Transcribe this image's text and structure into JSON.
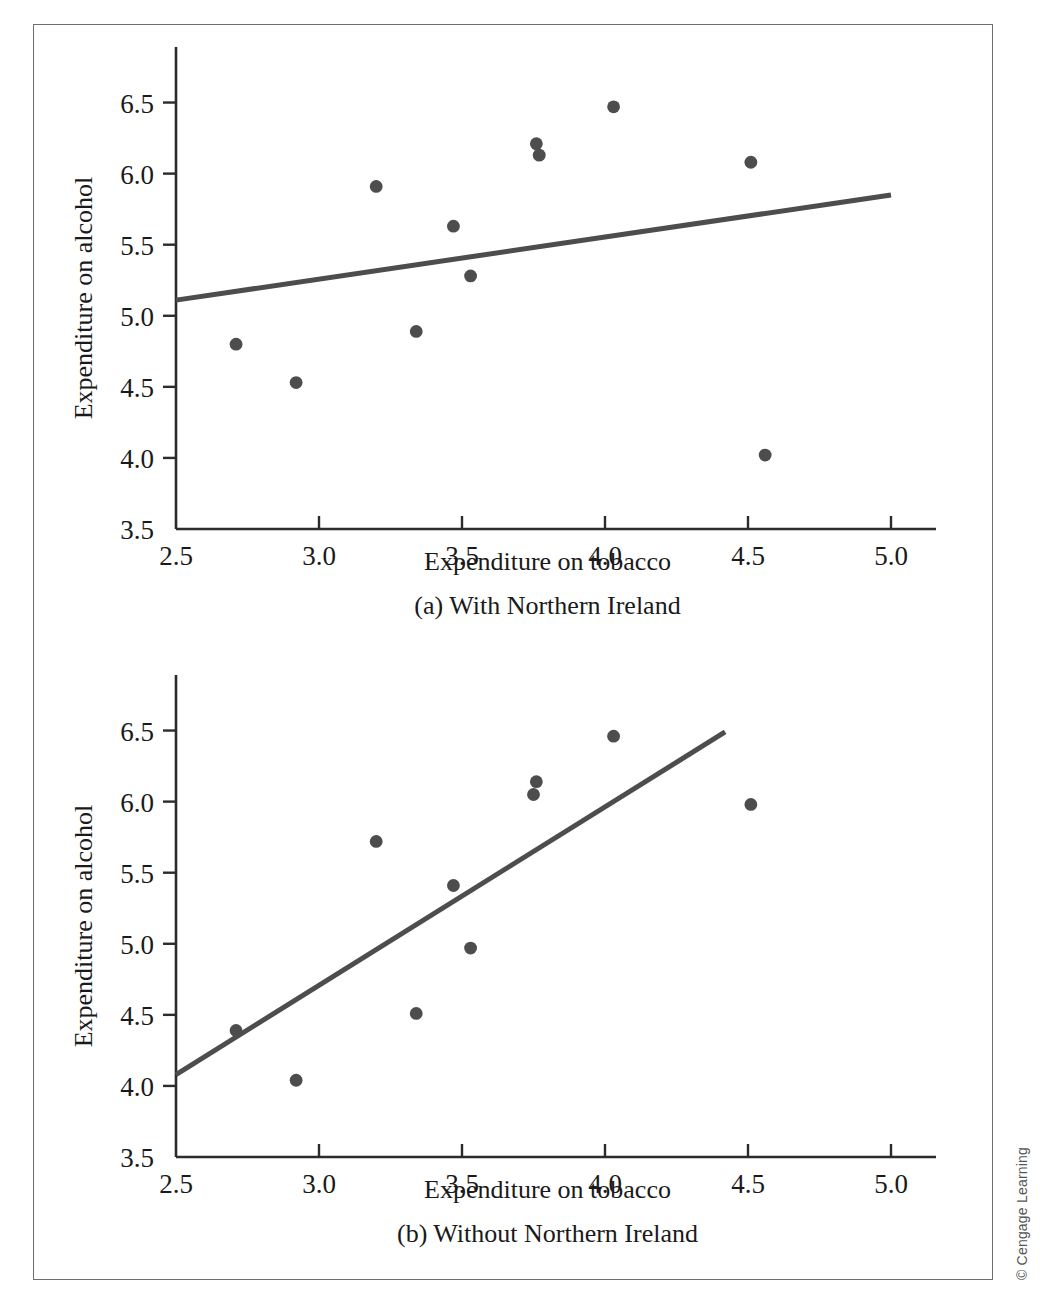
{
  "figure": {
    "copyright": "© Cengage Learning",
    "point_color": "#4d4d4d",
    "line_color": "#4d4d4d",
    "axis_color": "#2b2b2b",
    "frame_color": "#6e6e6e"
  },
  "chart_data": [
    {
      "type": "scatter",
      "panel": "a",
      "title": "(a) With Northern Ireland",
      "xlabel": "Expenditure on tobacco",
      "ylabel": "Expenditure on alcohol",
      "xlim": [
        2.5,
        5.0
      ],
      "ylim": [
        3.5,
        6.75
      ],
      "xticks": [
        2.5,
        3.0,
        3.5,
        4.0,
        4.5,
        5.0
      ],
      "xticklabels": [
        "2.5",
        "3.0",
        "3.5",
        "4.0",
        "4.5",
        "5.0"
      ],
      "yticks": [
        3.5,
        4.0,
        4.5,
        5.0,
        5.5,
        6.0,
        6.5
      ],
      "yticklabels": [
        "3.5",
        "4.0",
        "4.5",
        "5.0",
        "5.5",
        "6.0",
        "6.5"
      ],
      "grid": false,
      "legend": "none",
      "points": [
        {
          "x": 2.71,
          "y": 4.8
        },
        {
          "x": 2.92,
          "y": 4.53
        },
        {
          "x": 3.2,
          "y": 5.91
        },
        {
          "x": 3.34,
          "y": 4.89
        },
        {
          "x": 3.47,
          "y": 5.63
        },
        {
          "x": 3.53,
          "y": 5.28
        },
        {
          "x": 3.76,
          "y": 6.21
        },
        {
          "x": 3.77,
          "y": 6.13
        },
        {
          "x": 4.03,
          "y": 6.47
        },
        {
          "x": 4.51,
          "y": 6.08
        },
        {
          "x": 4.56,
          "y": 4.02
        }
      ],
      "fit_line": {
        "x_start": 2.5,
        "y_start": 5.11,
        "x_end": 5.0,
        "y_end": 5.85
      }
    },
    {
      "type": "scatter",
      "panel": "b",
      "title": "(b) Without Northern Ireland",
      "xlabel": "Expenditure on tobacco",
      "ylabel": "Expenditure on alcohol",
      "xlim": [
        2.5,
        5.0
      ],
      "ylim": [
        3.5,
        6.75
      ],
      "xticks": [
        2.5,
        3.0,
        3.5,
        4.0,
        4.5,
        5.0
      ],
      "xticklabels": [
        "2.5",
        "3.0",
        "3.5",
        "4.0",
        "4.5",
        "5.0"
      ],
      "yticks": [
        3.5,
        4.0,
        4.5,
        5.0,
        5.5,
        6.0,
        6.5
      ],
      "yticklabels": [
        "3.5",
        "4.0",
        "4.5",
        "5.0",
        "5.5",
        "6.0",
        "6.5"
      ],
      "grid": false,
      "legend": "none",
      "points": [
        {
          "x": 2.71,
          "y": 4.39
        },
        {
          "x": 2.92,
          "y": 4.04
        },
        {
          "x": 3.2,
          "y": 5.72
        },
        {
          "x": 3.34,
          "y": 4.51
        },
        {
          "x": 3.47,
          "y": 5.41
        },
        {
          "x": 3.53,
          "y": 4.97
        },
        {
          "x": 3.76,
          "y": 6.14
        },
        {
          "x": 3.75,
          "y": 6.05
        },
        {
          "x": 4.03,
          "y": 6.46
        },
        {
          "x": 4.51,
          "y": 5.98
        }
      ],
      "fit_line": {
        "x_start": 2.5,
        "y_start": 4.08,
        "x_end": 4.42,
        "y_end": 6.49
      }
    }
  ]
}
